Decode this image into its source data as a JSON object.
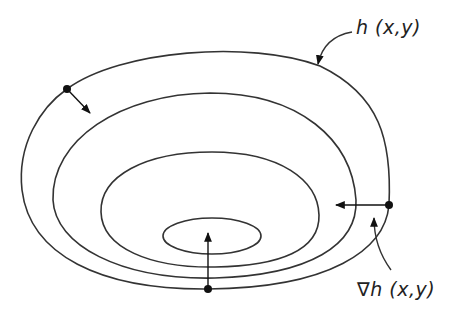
{
  "diagram": {
    "type": "contour-gradient-illustration",
    "labels": {
      "function_label": "h (x,y)",
      "gradient_label": "∇h (x,y)"
    },
    "contours": [
      {
        "name": "outer",
        "path": "M 67 89 C 120 50, 250 40, 320 66 C 380 95, 392 140, 389 205 C 385 245, 340 265, 250 270 C 130 275, 40 250, 24 185 C 18 140, 40 108, 67 89 Z"
      },
      {
        "name": "second",
        "path": "M 210 93 C 300 93, 350 140, 355 205 C 355 240, 310 262, 220 265 C 120 266, 55 240, 53 190 C 52 135, 120 94, 210 93 Z"
      },
      {
        "name": "third",
        "path": "M 212 152 C 280 152, 318 180, 318 215 C 318 245, 280 258, 215 259 C 150 260, 102 245, 102 210 C 102 175, 145 152, 212 152 Z"
      },
      {
        "name": "inner",
        "cx": 212,
        "cy": 236,
        "rx": 49,
        "ry": 18
      }
    ],
    "points": [
      {
        "name": "left-point",
        "x": 67,
        "y": 89,
        "vector_to": [
          90,
          113
        ]
      },
      {
        "name": "right-point",
        "x": 389,
        "y": 205,
        "vector_to": [
          336,
          205
        ]
      },
      {
        "name": "bottom-point",
        "x": 208,
        "y": 289,
        "vector_to": [
          208,
          233
        ]
      }
    ],
    "colors": {
      "line": "#333333",
      "point": "#111111",
      "background": "#ffffff"
    }
  }
}
